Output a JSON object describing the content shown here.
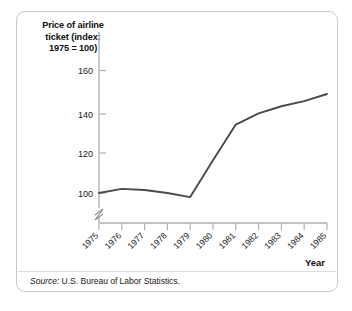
{
  "figure": {
    "y_axis_title": "Price of airline\nticket (index:\n1975 = 100)",
    "x_axis_title": "Year",
    "source_prefix": "Source:",
    "source_text": " U.S. Bureau of Labor Statistics.",
    "line_color": "#4a4a4a",
    "axis_color": "#b0b0b0",
    "panel_border_color": "#c9c9c9"
  },
  "chart_data": {
    "type": "line",
    "title": "",
    "xlabel": "Year",
    "ylabel": "Price of airline ticket (index: 1975 = 100)",
    "x": [
      1975,
      1976,
      1977,
      1978,
      1979,
      1980,
      1981,
      1982,
      1983,
      1984,
      1985
    ],
    "values": [
      100,
      102,
      101.5,
      100,
      98,
      116,
      133.5,
      139,
      142.5,
      145,
      148.5
    ],
    "xticklabels": [
      "1975",
      "1976",
      "1977",
      "1978",
      "1979",
      "1980",
      "1981",
      "1982",
      "1983",
      "1984",
      "1985"
    ],
    "yticks": [
      100,
      120,
      140,
      160
    ],
    "yticklabels": [
      "100",
      "120",
      "140",
      "160"
    ],
    "ylim": [
      96,
      168
    ],
    "xlim": [
      1975,
      1985
    ],
    "y_axis_break": true,
    "grid": false,
    "legend": false,
    "series": [
      {
        "name": "Price of airline ticket (index: 1975 = 100)",
        "values": [
          100,
          102,
          101.5,
          100,
          98,
          116,
          133.5,
          139,
          142.5,
          145,
          148.5
        ]
      }
    ]
  }
}
